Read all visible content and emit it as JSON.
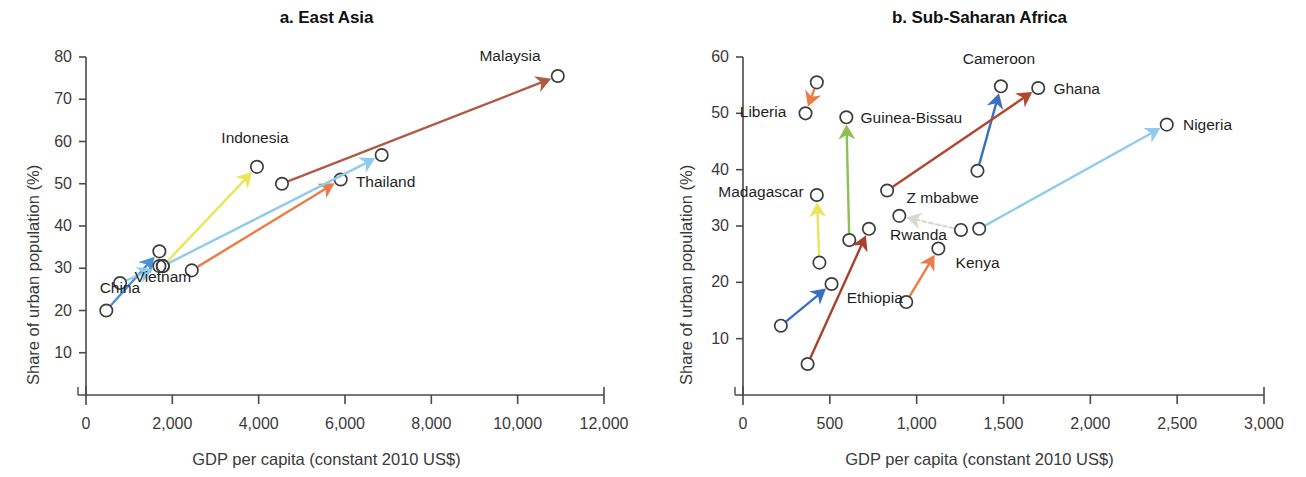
{
  "figure": {
    "axis_color": "#4a4a4a",
    "marker_color": "#3c3c3c"
  },
  "panels": [
    {
      "id": "a",
      "title": "a. East Asia",
      "xlabel": "GDP per capita (constant 2010 US$)",
      "ylabel": "Share of urban population (%)",
      "xticks": [
        "0",
        "2,000",
        "4,000",
        "6,000",
        "8,000",
        "10,000",
        "12,000"
      ],
      "yticks": [
        "10",
        "20",
        "30",
        "40",
        "50",
        "60",
        "70",
        "80"
      ]
    },
    {
      "id": "b",
      "title": "b. Sub-Saharan Africa",
      "xlabel": "GDP per capita (constant 2010 US$)",
      "ylabel": "Share of urban population (%)",
      "xticks": [
        "0",
        "500",
        "1,000",
        "1,500",
        "2,000",
        "2,500",
        "3,000"
      ],
      "yticks": [
        "10",
        "20",
        "30",
        "40",
        "50",
        "60"
      ]
    }
  ],
  "chart_data": [
    {
      "type": "scatter",
      "title": "a. East Asia",
      "xlabel": "GDP per capita (constant 2010 US$)",
      "ylabel": "Share of urban population (%)",
      "xlim": [
        0,
        12000
      ],
      "ylim": [
        0,
        80
      ],
      "xticks": [
        0,
        2000,
        4000,
        6000,
        8000,
        10000,
        12000
      ],
      "yticks": [
        10,
        20,
        30,
        40,
        50,
        60,
        70,
        80
      ],
      "grid": false,
      "legend": "none",
      "note": "Each country is an arrow from its start point (earlier year) to its end point (later year); open circles mark both ends.",
      "series": [
        {
          "name": "Vietnam",
          "color": "#4a90d9",
          "start": {
            "x": 470,
            "y": 20.0
          },
          "end": {
            "x": 1700,
            "y": 34.0
          },
          "label": "Vietnam",
          "label_pos": "right"
        },
        {
          "name": "China",
          "color": "#8ecbef",
          "start": {
            "x": 790,
            "y": 26.5
          },
          "end": {
            "x": 1700,
            "y": 30.5
          },
          "label": "China",
          "label_pos": "left"
        },
        {
          "name": "Indonesia",
          "color": "#eae55a",
          "start": {
            "x": 1780,
            "y": 30.5
          },
          "end": {
            "x": 3960,
            "y": 54.0
          },
          "label": "Indonesia",
          "label_pos": "above"
        },
        {
          "name": "Thailand",
          "color": "#ed7b45",
          "start": {
            "x": 2450,
            "y": 29.5
          },
          "end": {
            "x": 5900,
            "y": 51.0
          },
          "label": "Thailand",
          "label_pos": "right"
        },
        {
          "name": "Malaysia",
          "color": "#b05a46",
          "start": {
            "x": 4540,
            "y": 50.0
          },
          "end": {
            "x": 10930,
            "y": 75.5
          },
          "label": "Malaysia",
          "label_pos": "left"
        },
        {
          "name": "China-upper-track",
          "color": "#8ecbef",
          "start": {
            "x": 1780,
            "y": 30.5
          },
          "end": {
            "x": 6850,
            "y": 56.8
          },
          "label": "",
          "label_pos": "none"
        }
      ]
    },
    {
      "type": "scatter",
      "title": "b. Sub-Saharan Africa",
      "xlabel": "GDP per capita (constant 2010 US$)",
      "ylabel": "Share of urban population (%)",
      "xlim": [
        0,
        3000
      ],
      "ylim": [
        0,
        60
      ],
      "xticks": [
        0,
        500,
        1000,
        1500,
        2000,
        2500,
        3000
      ],
      "yticks": [
        10,
        20,
        30,
        40,
        50,
        60
      ],
      "grid": false,
      "legend": "none",
      "note": "Each country is an arrow from its start point (earlier year) to its end point (later year); open circles mark both ends.",
      "series": [
        {
          "name": "Liberia",
          "color": "#ed7b45",
          "start": {
            "x": 425,
            "y": 55.5
          },
          "end": {
            "x": 360,
            "y": 50.0
          },
          "label": "Liberia",
          "label_pos": "left"
        },
        {
          "name": "Guinea-Bissau",
          "color": "#8cc152",
          "start": {
            "x": 612,
            "y": 27.5
          },
          "end": {
            "x": 595,
            "y": 49.3
          },
          "label": "Guinea-Bissau",
          "label_pos": "right"
        },
        {
          "name": "Madagascar",
          "color": "#eae55a",
          "start": {
            "x": 440,
            "y": 23.5
          },
          "end": {
            "x": 425,
            "y": 35.5
          },
          "label": "Madagascar",
          "label_pos": "left"
        },
        {
          "name": "Cameroon",
          "color": "#3b6fc4",
          "start": {
            "x": 1350,
            "y": 39.8
          },
          "end": {
            "x": 1485,
            "y": 54.8
          },
          "label": "Cameroon",
          "label_pos": "above"
        },
        {
          "name": "Ghana",
          "color": "#b0482f",
          "start": {
            "x": 830,
            "y": 36.3
          },
          "end": {
            "x": 1700,
            "y": 54.5
          },
          "label": "Ghana",
          "label_pos": "right"
        },
        {
          "name": "Nigeria",
          "color": "#8ecbef",
          "start": {
            "x": 1360,
            "y": 29.5
          },
          "end": {
            "x": 2440,
            "y": 48.0
          },
          "label": "Nigeria",
          "label_pos": "right"
        },
        {
          "name": "Zimbabwe",
          "color": "#d8d8d0",
          "start": {
            "x": 1255,
            "y": 29.3
          },
          "end": {
            "x": 900,
            "y": 31.8
          },
          "label": "Z mbabwe",
          "label_pos": "right"
        },
        {
          "name": "Ethiopia",
          "color": "#3b6fc4",
          "start": {
            "x": 218,
            "y": 12.3
          },
          "end": {
            "x": 510,
            "y": 19.7
          },
          "label": "Ethiopia",
          "label_pos": "right"
        },
        {
          "name": "Rwanda",
          "color": "#a8422f",
          "start": {
            "x": 372,
            "y": 5.5
          },
          "end": {
            "x": 725,
            "y": 29.5
          },
          "label": "Rwanda",
          "label_pos": "right"
        },
        {
          "name": "Kenya",
          "color": "#ed7b45",
          "start": {
            "x": 940,
            "y": 16.5
          },
          "end": {
            "x": 1125,
            "y": 26.0
          },
          "label": "Kenya",
          "label_pos": "right"
        }
      ]
    }
  ]
}
